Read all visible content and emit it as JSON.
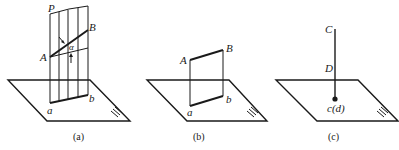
{
  "figures": [
    {
      "id": "a",
      "caption": "(a)",
      "labels": {
        "plane_P": "P",
        "point_A": "A",
        "point_B": "B",
        "angle": "α",
        "proj_a": "a",
        "proj_b": "b",
        "plane_H": "H"
      }
    },
    {
      "id": "b",
      "caption": "(b)",
      "labels": {
        "point_A": "A",
        "point_B": "B",
        "proj_a": "a",
        "proj_b": "b",
        "plane_H": "H"
      }
    },
    {
      "id": "c",
      "caption": "(c)",
      "labels": {
        "point_C": "C",
        "point_D": "D",
        "proj_cd": "c(d)",
        "plane_H": "H"
      }
    }
  ],
  "colors": {
    "stroke": "#1a1a1a",
    "background": "#ffffff"
  }
}
